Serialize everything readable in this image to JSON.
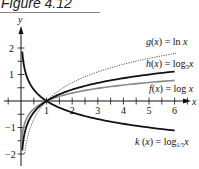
{
  "figure": {
    "title": "Figure 4.12"
  },
  "axes": {
    "x_label": "x",
    "y_label": "y"
  },
  "chart_data": {
    "type": "line",
    "title": "Figure 4.12",
    "xlabel": "x",
    "ylabel": "y",
    "xlim": [
      -0.8,
      6.8
    ],
    "ylim": [
      -2.3,
      2.6
    ],
    "x_ticks": [
      1,
      2,
      3,
      4,
      5,
      6
    ],
    "y_ticks": [
      -2,
      -1,
      1,
      2
    ],
    "grid": false,
    "legend_position": "inline-labels-right",
    "series": [
      {
        "name": "g(x) = ln x",
        "label_func": "g(x) = ln x",
        "style": "dotted",
        "color": "#555555",
        "x": [
          0.15,
          0.5,
          1,
          2,
          3,
          4,
          5,
          6
        ],
        "y": [
          -1.9,
          -0.69,
          0,
          0.69,
          1.1,
          1.39,
          1.61,
          1.79
        ]
      },
      {
        "name": "h(x) = log5 x",
        "label_func": "h(x) = log",
        "label_base": "5",
        "style": "solid-thick",
        "color": "#111111",
        "x": [
          0.05,
          0.5,
          1,
          2,
          3,
          4,
          5,
          6
        ],
        "y": [
          -1.86,
          -0.43,
          0,
          0.43,
          0.68,
          0.86,
          1.0,
          1.11
        ]
      },
      {
        "name": "f(x) = log x",
        "label_func": "f(x) = log x",
        "style": "solid-gray",
        "color": "#777777",
        "x": [
          0.01,
          0.5,
          1,
          2,
          3,
          4,
          5,
          6
        ],
        "y": [
          -2.0,
          -0.3,
          0,
          0.3,
          0.48,
          0.6,
          0.7,
          0.78
        ]
      },
      {
        "name": "k(x) = log1/5 x",
        "label_func": "k(x) = log",
        "label_base": "1/5",
        "style": "solid-thick",
        "color": "#111111",
        "x": [
          0.05,
          0.5,
          1,
          2,
          3,
          4,
          5,
          6
        ],
        "y": [
          1.86,
          0.43,
          0,
          -0.43,
          -0.68,
          -0.86,
          -1.0,
          -1.11
        ]
      }
    ]
  },
  "labels": {
    "g": {
      "text": "g(x) = ln x"
    },
    "h": {
      "text": "h(x) = log",
      "sub": "5",
      "tail": "x"
    },
    "f": {
      "text": "f(x) = log x"
    },
    "k": {
      "text": "k(x) = log",
      "sub": "1/5",
      "tail": "x"
    }
  },
  "ticks": {
    "x": [
      "1",
      "2",
      "3",
      "4",
      "5",
      "6"
    ],
    "y": [
      "2",
      "1",
      "−1",
      "−2"
    ]
  }
}
